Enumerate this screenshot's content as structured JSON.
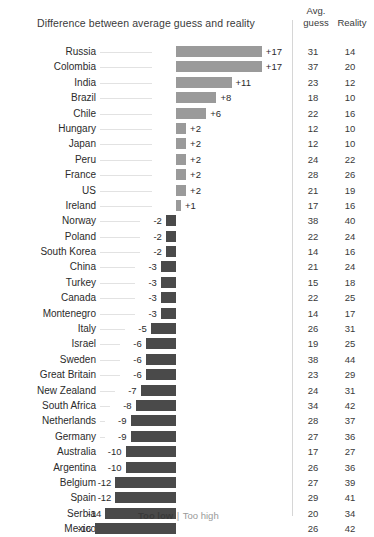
{
  "header": {
    "chart_title": "Difference between average guess and reality",
    "col_guess_line1": "Avg.",
    "col_guess_line2": "guess",
    "col_reality_line1": "",
    "col_reality_line2": "Reality"
  },
  "legend": {
    "too_low": "Too low",
    "separator": "|",
    "too_high": "Too high"
  },
  "chart_data": {
    "type": "bar",
    "orientation": "horizontal",
    "title": "Difference between average guess and reality",
    "xlabel": "",
    "ylabel": "",
    "xlim": [
      -16,
      17
    ],
    "grid": false,
    "legend_position": "bottom",
    "legend_entries": [
      "Too low",
      "Too high"
    ],
    "colors": {
      "too_high": "#9a9a9a",
      "too_low": "#4a4a4a",
      "leader_line": "#e2e2e2"
    },
    "columns": [
      "Country",
      "Difference",
      "Avg. guess",
      "Reality"
    ],
    "categories": [
      "Russia",
      "Colombia",
      "India",
      "Brazil",
      "Chile",
      "Hungary",
      "Japan",
      "Peru",
      "France",
      "US",
      "Ireland",
      "Norway",
      "Poland",
      "South Korea",
      "China",
      "Turkey",
      "Canada",
      "Montenegro",
      "Italy",
      "Israel",
      "Sweden",
      "Great Britain",
      "New Zealand",
      "South Africa",
      "Netherlands",
      "Germany",
      "Australia",
      "Argentina",
      "Belgium",
      "Spain",
      "Serbia",
      "Mexico"
    ],
    "values": [
      17,
      17,
      11,
      8,
      6,
      2,
      2,
      2,
      2,
      2,
      1,
      -2,
      -2,
      -2,
      -3,
      -3,
      -3,
      -3,
      -5,
      -6,
      -6,
      -6,
      -7,
      -8,
      -9,
      -9,
      -10,
      -10,
      -12,
      -12,
      -14,
      -16
    ],
    "value_labels": [
      "+17",
      "+17",
      "+11",
      "+8",
      "+6",
      "+2",
      "+2",
      "+2",
      "+2",
      "+2",
      "+1",
      "-2",
      "-2",
      "-2",
      "-3",
      "-3",
      "-3",
      "-3",
      "-5",
      "-6",
      "-6",
      "-6",
      "-7",
      "-8",
      "-9",
      "-9",
      "-10",
      "-10",
      "-12",
      "-12",
      "-14",
      "-16"
    ],
    "series": [
      {
        "name": "Avg. guess",
        "values": [
          31,
          37,
          23,
          18,
          22,
          12,
          12,
          24,
          28,
          21,
          17,
          38,
          22,
          14,
          21,
          15,
          22,
          14,
          26,
          19,
          38,
          23,
          24,
          34,
          28,
          27,
          17,
          26,
          27,
          29,
          20,
          26
        ]
      },
      {
        "name": "Reality",
        "values": [
          14,
          20,
          12,
          10,
          16,
          10,
          10,
          22,
          26,
          19,
          16,
          40,
          24,
          16,
          24,
          18,
          25,
          17,
          31,
          25,
          44,
          29,
          31,
          42,
          37,
          36,
          27,
          36,
          39,
          41,
          34,
          42
        ]
      }
    ]
  }
}
